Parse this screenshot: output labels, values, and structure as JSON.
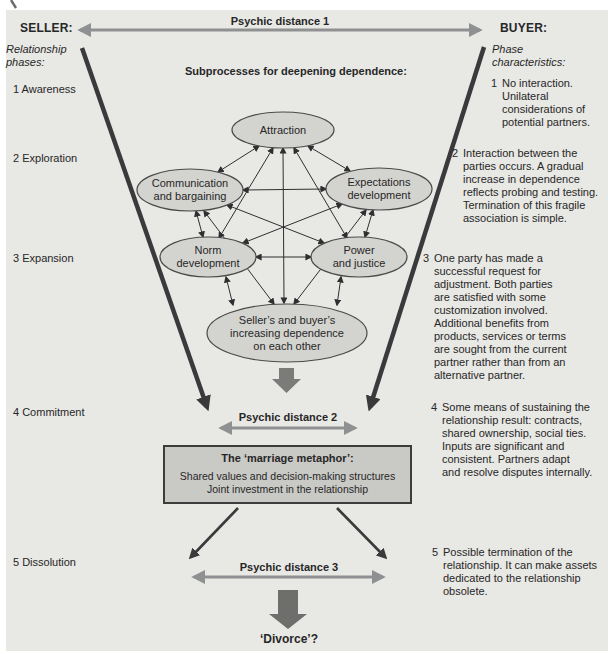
{
  "figure": {
    "header": {
      "seller": "SELLER:",
      "buyer": "BUYER:",
      "psychic_distance_1": "Psychic distance 1"
    },
    "left_column": {
      "title": "Relationship\nphases:",
      "phases": [
        {
          "label": "1 Awareness"
        },
        {
          "label": "2 Exploration"
        },
        {
          "label": "3 Expansion"
        },
        {
          "label": "4 Commitment"
        },
        {
          "label": "5 Dissolution"
        }
      ]
    },
    "right_column": {
      "title": "Phase\ncharacteristics:",
      "items": [
        {
          "num": "1",
          "text": "No interaction.\nUnilateral\nconsiderations of\npotential partners."
        },
        {
          "num": "2",
          "text": "Interaction between the\nparties occurs. A gradual\nincrease in dependence\nreflects probing and testing.\nTermination of this fragile\nassociation is simple."
        },
        {
          "num": "3",
          "text": "One party has made a\nsuccessful request for\nadjustment. Both parties\nare satisfied with some\ncustomization involved.\nAdditional benefits from\nproducts, services or terms\nare sought from the current\npartner rather than from an\nalternative partner."
        },
        {
          "num": "4",
          "text": "Some means of sustaining the\nrelationship result: contracts,\nshared ownership, social ties.\nInputs are significant and\nconsistent. Partners adapt\nand resolve disputes internally."
        },
        {
          "num": "5",
          "text": "Possible termination of the\nrelationship. It can make assets\ndedicated to the relationship\nobsolete."
        }
      ]
    },
    "center": {
      "subprocesses_title": "Subprocesses for deepening dependence:",
      "nodes": [
        {
          "label": "Attraction"
        },
        {
          "label": "Communication\nand bargaining"
        },
        {
          "label": "Expectations\ndevelopment"
        },
        {
          "label": "Norm\ndevelopment"
        },
        {
          "label": "Power\nand justice"
        },
        {
          "label": "Seller’s and buyer’s\nincreasing dependence\non each other"
        }
      ],
      "psychic_distance_2": "Psychic distance 2",
      "marriage_box": {
        "title": "The ‘marriage metaphor’:",
        "lines": "Shared values and decision-making structures\nJoint investment in the relationship"
      },
      "psychic_distance_3": "Psychic distance 3",
      "divorce": "‘Divorce’?"
    },
    "colors": {
      "panel_bg": "#e8e8e4",
      "ellipse_fill": "#d3d3cf",
      "box_fill": "#c9c9c5",
      "arrow_gray": "#8f9092",
      "line_dark": "#3a3a3d",
      "block_arrow": "#6e6e6c",
      "text": "#272727"
    }
  }
}
